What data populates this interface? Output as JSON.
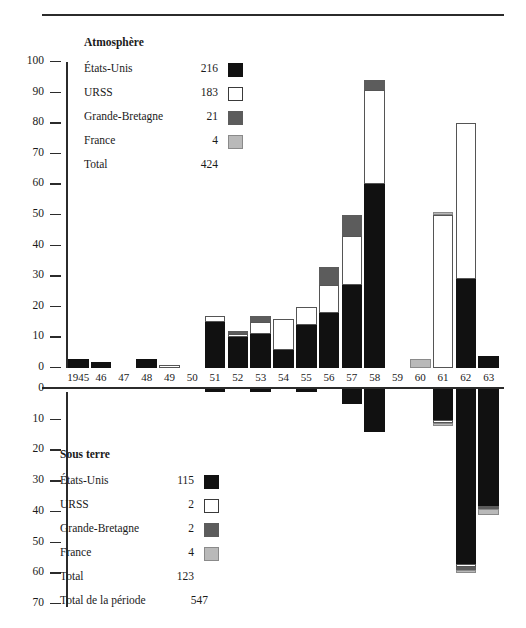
{
  "header": {
    "cut_text": "",
    "rule": "horizontal-rule"
  },
  "upper_legend": {
    "title": "Atmosphère",
    "rows": [
      {
        "name": "États-Unis",
        "value": "216",
        "key": "us"
      },
      {
        "name": "URSS",
        "value": "183",
        "key": "su"
      },
      {
        "name": "Grande-Bretagne",
        "value": "21",
        "key": "gb"
      },
      {
        "name": "France",
        "value": "4",
        "key": "fr"
      }
    ],
    "total_label": "Total",
    "total_value": "424"
  },
  "lower_legend": {
    "title": "Sous terre",
    "rows": [
      {
        "name": "États-Unis",
        "value": "115",
        "key": "us"
      },
      {
        "name": "URSS",
        "value": "2",
        "key": "su"
      },
      {
        "name": "Grande-Bretagne",
        "value": "2",
        "key": "gb"
      },
      {
        "name": "France",
        "value": "4",
        "key": "fr"
      }
    ],
    "total_label": "Total",
    "total_value": "123",
    "period_label": "Total de la période",
    "period_value": "547"
  },
  "axes": {
    "upper_ticks": [
      "100",
      "90",
      "80",
      "70",
      "60",
      "50",
      "40",
      "30",
      "20",
      "10",
      "0"
    ],
    "lower_ticks": [
      "0",
      "10",
      "20",
      "30",
      "40",
      "50",
      "60",
      "70"
    ],
    "x_ticks": [
      "1945",
      "46",
      "47",
      "48",
      "49",
      "50",
      "51",
      "52",
      "53",
      "54",
      "55",
      "56",
      "57",
      "58",
      "59",
      "60",
      "61",
      "62",
      "63"
    ]
  },
  "colors": {
    "us": "#111111",
    "su": "#ffffff",
    "gb": "#5c5c5c",
    "fr": "#b9b9b9",
    "ink": "#1a1a1a"
  },
  "chart_data": {
    "type": "bar",
    "subcharts": [
      "Atmosphère",
      "Sous terre"
    ],
    "xlabel": "",
    "ylabel": "",
    "stacked": true,
    "grid": false,
    "legend_position": "inside-left",
    "categories": [
      "1945",
      "46",
      "47",
      "48",
      "49",
      "50",
      "51",
      "52",
      "53",
      "54",
      "55",
      "56",
      "57",
      "58",
      "59",
      "60",
      "61",
      "62",
      "63"
    ],
    "atmosphere": {
      "ylim": [
        0,
        100
      ],
      "series": [
        {
          "name": "États-Unis",
          "key": "us",
          "values": [
            3,
            2,
            0,
            3,
            0,
            0,
            15,
            10,
            11,
            6,
            14,
            18,
            27,
            60,
            0,
            0,
            0,
            29,
            4
          ]
        },
        {
          "name": "URSS",
          "key": "su",
          "values": [
            0,
            0,
            0,
            0,
            1,
            0,
            2,
            1,
            4,
            10,
            6,
            9,
            16,
            31,
            0,
            0,
            50,
            51,
            0
          ]
        },
        {
          "name": "Grande-Bretagne",
          "key": "gb",
          "values": [
            0,
            0,
            0,
            0,
            0,
            0,
            0,
            1,
            2,
            0,
            0,
            6,
            7,
            3,
            0,
            0,
            0,
            0,
            0
          ]
        },
        {
          "name": "France",
          "key": "fr",
          "values": [
            0,
            0,
            0,
            0,
            0,
            0,
            0,
            0,
            0,
            0,
            0,
            0,
            0,
            0,
            0,
            3,
            1,
            0,
            0
          ]
        }
      ],
      "totals": [
        3,
        2,
        0,
        3,
        1,
        0,
        17,
        12,
        17,
        16,
        20,
        33,
        50,
        94,
        0,
        3,
        51,
        80,
        4
      ]
    },
    "sous_terre": {
      "ylim": [
        0,
        70
      ],
      "direction": "down",
      "series": [
        {
          "name": "États-Unis",
          "key": "us",
          "values": [
            0,
            0,
            0,
            0,
            0,
            0,
            1,
            0,
            1,
            0,
            1,
            0,
            5,
            14,
            0,
            0,
            10,
            57,
            38
          ]
        },
        {
          "name": "URSS",
          "key": "su",
          "values": [
            0,
            0,
            0,
            0,
            0,
            0,
            0,
            0,
            0,
            0,
            0,
            0,
            0,
            0,
            0,
            0,
            1,
            1,
            0
          ]
        },
        {
          "name": "Grande-Bretagne",
          "key": "gb",
          "values": [
            0,
            0,
            0,
            0,
            0,
            0,
            0,
            0,
            0,
            0,
            0,
            0,
            0,
            0,
            0,
            0,
            0,
            1,
            1
          ]
        },
        {
          "name": "France",
          "key": "fr",
          "values": [
            0,
            0,
            0,
            0,
            0,
            0,
            0,
            0,
            0,
            0,
            0,
            0,
            0,
            0,
            0,
            0,
            1,
            1,
            2
          ]
        }
      ],
      "totals": [
        0,
        0,
        0,
        0,
        0,
        0,
        1,
        0,
        1,
        0,
        1,
        0,
        5,
        14,
        0,
        0,
        12,
        60,
        41
      ]
    }
  }
}
